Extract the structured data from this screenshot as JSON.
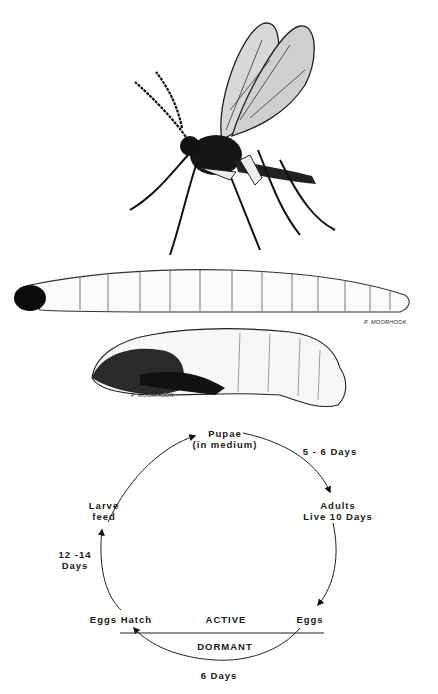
{
  "figure": {
    "illustrations": {
      "adult": {
        "label": "adult-fungus-gnat"
      },
      "larva": {
        "label": "larva",
        "signature": "P. MOORHOOK"
      },
      "pupa": {
        "label": "pupa",
        "signature": "P. MOORHOON"
      }
    },
    "life_cycle": {
      "stages": {
        "pupae_line1": "Pupae",
        "pupae_line2": "(in medium)",
        "adults_line1": "Adults",
        "adults_line2": "Live 10 Days",
        "eggs": "Eggs",
        "eggs_hatch": "Eggs Hatch",
        "larve_line1": "Larve",
        "larve_line2": "feed"
      },
      "durations": {
        "pupae_to_adults": "5 - 6 Days",
        "hatch_to_larve_line1": "12 -14",
        "hatch_to_larve_line2": "Days",
        "eggs_to_hatch": "6 Days"
      },
      "zones": {
        "active": "ACTIVE",
        "dormant": "DORMANT"
      }
    }
  }
}
